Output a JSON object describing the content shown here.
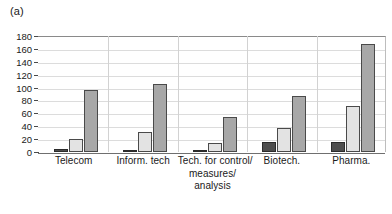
{
  "figure": {
    "panel_label": "(a)"
  },
  "chart_data": {
    "type": "bar",
    "title": "",
    "xlabel": "",
    "ylabel": "",
    "ylim": [
      0,
      180
    ],
    "ytick_step": 20,
    "yticks": [
      180,
      160,
      140,
      120,
      100,
      80,
      60,
      40,
      20,
      0
    ],
    "ytick_labels": [
      "180",
      "160",
      "140",
      "120",
      "100",
      "80",
      "60",
      "40",
      "20",
      "0"
    ],
    "grid": true,
    "legend": false,
    "grouped": true,
    "categories": [
      "Telecom",
      "Inform. tech",
      "Tech. for control/ measures/ analysis",
      "Biotech.",
      "Pharma."
    ],
    "category_lines": [
      [
        "Telecom"
      ],
      [
        "Inform. tech"
      ],
      [
        "Tech. for control/",
        "measures/",
        "analysis"
      ],
      [
        "Biotech."
      ],
      [
        "Pharma."
      ]
    ],
    "series": [
      {
        "name": "series-1",
        "color": "#4d4d4d",
        "values": [
          5,
          3,
          3,
          16,
          15
        ]
      },
      {
        "name": "series-2",
        "color": "#e3e3e3",
        "values": [
          20,
          31,
          14,
          37,
          72
        ]
      },
      {
        "name": "series-3",
        "color": "#a8a8a8",
        "values": [
          96,
          106,
          54,
          87,
          167
        ]
      }
    ]
  }
}
